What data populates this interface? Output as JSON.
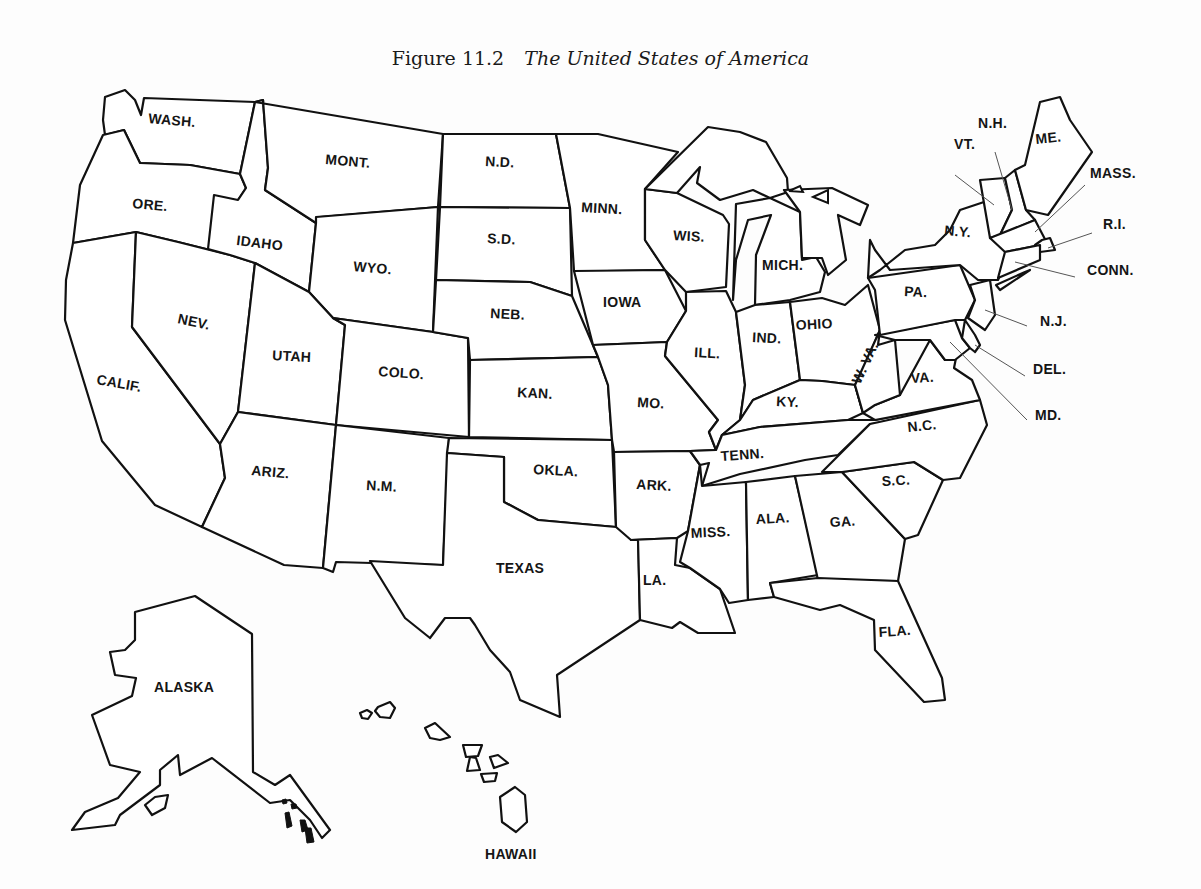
{
  "caption": {
    "figure_number": "Figure 11.2",
    "title": "The United States of America"
  },
  "colors": {
    "outline": "#111111",
    "fill": "#ffffff",
    "background": "#fdfdfd",
    "leader": "#555555"
  },
  "states": [
    {
      "id": "wash",
      "label": "WASH.",
      "lx": 148,
      "ly": 123,
      "rot": 5,
      "points": "105,97 125,90 135,100 141,115 144,98 255,102 240,174 190,165 140,163 124,130 105,135 103,120"
    },
    {
      "id": "ore",
      "label": "ORE.",
      "lx": 132,
      "ly": 208,
      "rot": 5,
      "points": "103,135 124,130 140,163 190,165 240,174 246,188 238,200 230,255 178,242 136,232 73,243 80,185"
    },
    {
      "id": "calif",
      "label": "CALIF.",
      "lx": 96,
      "ly": 384,
      "rot": 10,
      "points": "73,243 136,232 132,327 220,444 225,478 202,527 155,505 102,441 65,320 66,280"
    },
    {
      "id": "nev",
      "label": "NEV.",
      "lx": 177,
      "ly": 323,
      "rot": 12,
      "points": "136,232 178,242 230,255 255,263 238,412 220,444 132,327"
    },
    {
      "id": "idaho",
      "label": "IDAHO",
      "lx": 236,
      "ly": 245,
      "rot": 7,
      "points": "240,174 255,102 263,100 268,168 265,190 316,223 309,292 255,263 230,255 208,249 214,195 238,200 246,188"
    },
    {
      "id": "mont",
      "label": "MONT.",
      "lx": 325,
      "ly": 164,
      "rot": 5,
      "points": "255,102 443,134 438,207 320,217 316,223 265,190 268,168 263,100"
    },
    {
      "id": "wyo",
      "label": "WYO.",
      "lx": 353,
      "ly": 271,
      "rot": 5,
      "points": "316,217 438,207 433,332 333,318 309,292 316,223"
    },
    {
      "id": "utah",
      "label": "UTAH",
      "lx": 272,
      "ly": 360,
      "rot": 3,
      "points": "255,263 309,292 333,318 345,325 336,425 238,412"
    },
    {
      "id": "colo",
      "label": "COLO.",
      "lx": 378,
      "ly": 376,
      "rot": 4,
      "points": "345,325 333,318 433,332 468,338 469,437 336,425"
    },
    {
      "id": "ariz",
      "label": "ARIZ.",
      "lx": 251,
      "ly": 475,
      "rot": 5,
      "points": "238,412 336,425 323,568 284,565 202,527 225,478 220,444"
    },
    {
      "id": "nm",
      "label": "N.M.",
      "lx": 366,
      "ly": 490,
      "rot": 3,
      "points": "336,425 449,438 443,565 336,562 333,572 323,568"
    },
    {
      "id": "nd",
      "label": "N.D.",
      "lx": 485,
      "ly": 166,
      "rot": 3,
      "points": "443,134 556,134 570,208 440,207"
    },
    {
      "id": "sd",
      "label": "S.D.",
      "lx": 487,
      "ly": 243,
      "rot": 3,
      "points": "440,207 570,208 572,296 530,282 436,280"
    },
    {
      "id": "neb",
      "label": "NEB.",
      "lx": 490,
      "ly": 318,
      "rot": 3,
      "points": "436,280 530,282 572,296 598,357 470,360 468,338 433,332"
    },
    {
      "id": "kan",
      "label": "KAN.",
      "lx": 517,
      "ly": 397,
      "rot": 3,
      "points": "470,360 598,357 608,385 612,440 469,437"
    },
    {
      "id": "okla",
      "label": "OKLA.",
      "lx": 533,
      "ly": 474,
      "rot": 3,
      "points": "449,438 612,440 616,527 538,520 504,502 504,457 447,453"
    },
    {
      "id": "texas",
      "label": "TEXAS",
      "lx": 496,
      "ly": 573,
      "rot": 0,
      "points": "447,453 504,457 504,502 538,520 616,527 638,527 640,620 557,675 560,717 520,700 510,672 490,650 475,625 470,618 445,618 430,638 405,618 370,561 443,565"
    },
    {
      "id": "minn",
      "label": "MINN.",
      "lx": 581,
      "ly": 212,
      "rot": 3,
      "points": "556,134 598,134 678,152 645,189 645,240 665,270 606,271 574,271 570,208"
    },
    {
      "id": "iowa",
      "label": "IOWA",
      "lx": 603,
      "ly": 307,
      "rot": 0,
      "points": "574,271 665,270 686,311 667,342 593,345"
    },
    {
      "id": "mo",
      "label": "MO.",
      "lx": 637,
      "ly": 407,
      "rot": 3,
      "points": "593,345 667,342 665,356 718,420 709,432 716,450 690,451 614,452 612,440 608,385 598,357"
    },
    {
      "id": "ark",
      "label": "ARK.",
      "lx": 636,
      "ly": 489,
      "rot": 3,
      "points": "614,452 690,451 700,465 688,531 677,538 631,540 616,527"
    },
    {
      "id": "la",
      "label": "LA.",
      "lx": 643,
      "ly": 585,
      "rot": 0,
      "points": "631,540 677,538 675,565 690,568 720,589 735,633 698,633 680,622 672,628 640,620 638,540"
    },
    {
      "id": "wis",
      "label": "WIS.",
      "lx": 673,
      "ly": 240,
      "rot": 3,
      "points": "645,189 677,193 723,215 729,224 726,287 686,292 665,270 645,240"
    },
    {
      "id": "ill",
      "label": "ILL.",
      "lx": 694,
      "ly": 357,
      "rot": 3,
      "points": "686,292 726,291 736,312 745,385 740,420 722,435 716,450 709,432 718,420 665,356 667,342 686,311"
    },
    {
      "id": "mich_up",
      "label": "",
      "lx": 0,
      "ly": 0,
      "rot": 0,
      "points": "645,189 708,127 740,132 766,142 787,178 788,192 770,198 753,190 720,200 697,183 700,167 677,193"
    },
    {
      "id": "mich",
      "label": "MICH.",
      "lx": 762,
      "ly": 270,
      "rot": 0,
      "points": "736,204 770,198 785,205 800,212 802,260 816,257 825,272 820,292 790,300 755,305 756,255 771,215 748,220 736,260 733,300"
    },
    {
      "id": "mich_lp",
      "label": "",
      "lx": 0,
      "ly": 0,
      "rot": 0,
      "points": "784,190 832,188 868,205 860,225 838,215 846,260 828,275 822,258 802,258 800,212"
    },
    {
      "id": "ind",
      "label": "IND.",
      "lx": 752,
      "ly": 342,
      "rot": 3,
      "points": "736,312 755,305 790,302 800,380 753,400 740,420 745,385"
    },
    {
      "id": "ohio",
      "label": "OHIO",
      "lx": 796,
      "ly": 330,
      "rot": -3,
      "points": "790,302 822,298 845,305 868,285 880,330 865,365 855,385 822,381 800,380"
    },
    {
      "id": "ky",
      "label": "KY.",
      "lx": 776,
      "ly": 406,
      "rot": 3,
      "points": "740,420 753,400 800,380 822,381 855,385 863,413 848,420 760,427 722,435"
    },
    {
      "id": "tenn",
      "label": "TENN.",
      "lx": 721,
      "ly": 461,
      "rot": -4,
      "points": "716,450 722,435 760,427 848,420 875,420 980,400 920,420 870,424 838,455 805,460 740,474 702,486 709,463 700,465 690,451"
    },
    {
      "id": "miss",
      "label": "MISS.",
      "lx": 691,
      "ly": 538,
      "rot": -3,
      "points": "702,486 746,482 748,600 729,603 720,589 690,568 680,562 688,531 700,465"
    },
    {
      "id": "ala",
      "label": "ALA.",
      "lx": 756,
      "ly": 524,
      "rot": -3,
      "points": "746,482 795,476 818,575 770,583 774,597 748,600"
    },
    {
      "id": "ga",
      "label": "GA.",
      "lx": 830,
      "ly": 527,
      "rot": -3,
      "points": "795,476 842,472 905,539 898,581 818,580"
    },
    {
      "id": "fla",
      "label": "FLA.",
      "lx": 879,
      "ly": 637,
      "rot": -4,
      "points": "770,583 818,578 898,581 942,678 945,700 924,702 875,650 874,620 840,605 820,610 774,597"
    },
    {
      "id": "sc",
      "label": "S.C.",
      "lx": 882,
      "ly": 486,
      "rot": -3,
      "points": "842,472 914,462 943,480 918,535 905,539"
    },
    {
      "id": "nc",
      "label": "N.C.",
      "lx": 908,
      "ly": 432,
      "rot": -6,
      "points": "870,424 980,400 987,425 960,478 943,480 914,462 842,472 822,472"
    },
    {
      "id": "va",
      "label": "VA.",
      "lx": 911,
      "ly": 383,
      "rot": -3,
      "points": "855,385 863,413 875,420 980,400 972,380 954,368 956,358 945,360 930,340 900,395 875,405"
    },
    {
      "id": "wva",
      "label": "W. VA.",
      "lx": 860,
      "ly": 385,
      "rot": -65,
      "points": "855,385 880,330 878,345 895,340 900,395 875,405 863,413"
    },
    {
      "id": "md",
      "label": "",
      "lx": 0,
      "ly": 0,
      "rot": 0,
      "points": "875,335 955,320 962,338 970,348 955,360 945,360 930,340 895,340"
    },
    {
      "id": "del",
      "label": "",
      "lx": 0,
      "ly": 0,
      "rot": 0,
      "points": "965,320 975,335 980,345 975,352 970,348 962,338"
    },
    {
      "id": "pa",
      "label": "PA.",
      "lx": 904,
      "ly": 296,
      "rot": 3,
      "points": "868,278 960,265 975,300 965,320 955,320 880,335 875,290"
    },
    {
      "id": "nj",
      "label": "N.J.",
      "lx": 0,
      "ly": 0,
      "rot": 0,
      "points": "970,285 990,280 995,315 985,330 968,318 975,300"
    },
    {
      "id": "ny",
      "label": "N.Y.",
      "lx": 944,
      "ly": 235,
      "rot": 5,
      "points": "868,278 880,270 890,262 905,250 935,245 950,230 960,210 990,200 1000,198 1012,250 998,280 978,280 960,265 890,270 875,250 870,240"
    },
    {
      "id": "vt",
      "label": "",
      "lx": 0,
      "ly": 0,
      "rot": 0,
      "points": "980,180 1005,178 1012,210 1000,235 990,238"
    },
    {
      "id": "nh",
      "label": "",
      "lx": 0,
      "ly": 0,
      "rot": 0,
      "points": "1005,178 1015,170 1026,210 1035,220 1000,235 1012,210"
    },
    {
      "id": "me",
      "label": "ME.",
      "lx": 1036,
      "ly": 144,
      "rot": -6,
      "points": "1015,170 1025,165 1040,102 1060,97 1070,120 1092,152 1048,215 1026,210"
    },
    {
      "id": "mass",
      "label": "",
      "lx": 0,
      "ly": 0,
      "rot": 0,
      "points": "990,238 1035,220 1048,245 1040,245 1005,252"
    },
    {
      "id": "ri",
      "label": "",
      "lx": 0,
      "ly": 0,
      "rot": 0,
      "points": "1035,245 1042,240 1050,238 1055,250 1040,252"
    },
    {
      "id": "conn",
      "label": "",
      "lx": 0,
      "ly": 0,
      "rot": 0,
      "points": "1005,252 1040,245 1040,260 998,278"
    },
    {
      "id": "li",
      "label": "",
      "lx": 0,
      "ly": 0,
      "rot": 0,
      "points": "996,285 1025,272 1030,270 1000,290"
    },
    {
      "id": "alaska",
      "label": "ALASKA",
      "lx": 154,
      "ly": 692,
      "rot": 0,
      "points": "135,612 195,596 252,634 253,772 275,785 290,775 330,830 322,838 310,820 290,800 270,803 212,758 180,775 178,755 160,770 160,785 120,815 115,825 72,830 85,812 118,798 140,772 110,765 92,715 132,696 136,678 115,675 110,652 125,650 135,640"
    },
    {
      "id": "ak_island",
      "label": "",
      "lx": 0,
      "ly": 0,
      "rot": 0,
      "points": "145,805 155,797 168,795 165,808 152,815"
    }
  ],
  "leaders": [
    {
      "id": "vt",
      "label": "VT.",
      "lx": 954,
      "ly": 149,
      "x1": 955,
      "y1": 175,
      "x2": 994,
      "y2": 205
    },
    {
      "id": "nh",
      "label": "N.H.",
      "lx": 978,
      "ly": 128,
      "x1": 995,
      "y1": 152,
      "x2": 1012,
      "y2": 210
    },
    {
      "id": "mass",
      "label": "MASS.",
      "lx": 1090,
      "ly": 178,
      "x1": 1085,
      "y1": 185,
      "x2": 1035,
      "y2": 232
    },
    {
      "id": "ri",
      "label": "R.I.",
      "lx": 1103,
      "ly": 229,
      "x1": 1092,
      "y1": 233,
      "x2": 1048,
      "y2": 248
    },
    {
      "id": "conn",
      "label": "CONN.",
      "lx": 1087,
      "ly": 275,
      "x1": 1075,
      "y1": 277,
      "x2": 1015,
      "y2": 262
    },
    {
      "id": "nj",
      "label": "N.J.",
      "lx": 1040,
      "ly": 326,
      "x1": 1027,
      "y1": 326,
      "x2": 985,
      "y2": 310
    },
    {
      "id": "del",
      "label": "DEL.",
      "lx": 1033,
      "ly": 374,
      "x1": 1025,
      "y1": 376,
      "x2": 975,
      "y2": 345
    },
    {
      "id": "md",
      "label": "MD.",
      "lx": 1035,
      "ly": 420,
      "x1": 1027,
      "y1": 420,
      "x2": 950,
      "y2": 342
    }
  ],
  "great_lakes": [
    {
      "id": "lake-island",
      "points": "813,197 828,190 828,203"
    },
    {
      "id": "mich-gap",
      "points": "789,191 800,186 803,192"
    }
  ],
  "ak_panhandle_islands": [
    {
      "points": "282,800 286,799 287,803 283,804"
    },
    {
      "points": "291,804 296,804 297,808 292,809"
    },
    {
      "points": "285,813 289,812 292,826 287,828"
    },
    {
      "points": "300,820 305,820 308,830 302,832"
    },
    {
      "points": "305,828 311,828 314,842 307,843"
    }
  ],
  "hawaii": {
    "label": "HAWAII",
    "lx": 485,
    "ly": 859,
    "islands": [
      {
        "points": "360,713 367,710 372,713 368,719 362,718"
      },
      {
        "points": "378,707 390,702 395,708 390,718 380,717 375,711"
      },
      {
        "points": "425,728 435,723 450,737 440,740 430,738"
      },
      {
        "points": "463,745 482,745 478,756 466,757"
      },
      {
        "points": "470,757 476,758 480,770 467,771"
      },
      {
        "points": "490,757 498,755 508,763 494,768"
      },
      {
        "points": "481,774 497,773 495,781 484,782"
      },
      {
        "points": "515,787 525,795 527,822 516,832 502,822 500,797"
      }
    ]
  }
}
